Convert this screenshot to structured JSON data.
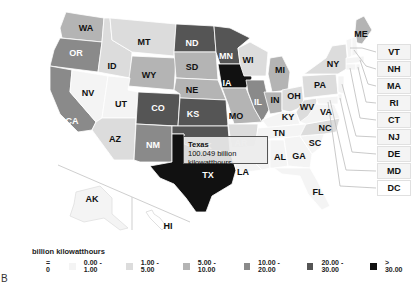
{
  "chart_data": {
    "type": "choropleth",
    "title": "",
    "legend_title": "billion kilowatthours",
    "bins": [
      {
        "label": "= 0",
        "color": "#ffffff"
      },
      {
        "label": "0.00 - 1.00",
        "color": "#f4f4f4"
      },
      {
        "label": "1.00 - 5.00",
        "color": "#dcdcdc"
      },
      {
        "label": "5.00 - 10.00",
        "color": "#b4b4b4"
      },
      {
        "label": "10.00 - 20.00",
        "color": "#8a8a8a"
      },
      {
        "label": "20.00 - 30.00",
        "color": "#555555"
      },
      {
        "label": "> 30.00",
        "color": "#111111"
      }
    ],
    "states": {
      "WA": 3,
      "OR": 4,
      "CA": 4,
      "NV": 1,
      "ID": 2,
      "MT": 2,
      "WY": 3,
      "UT": 1,
      "AZ": 2,
      "CO": 5,
      "NM": 4,
      "ND": 5,
      "SD": 3,
      "NE": 3,
      "KS": 5,
      "OK": 5,
      "TX": 6,
      "MN": 5,
      "IA": 6,
      "MO": 3,
      "AR": 2,
      "LA": 1,
      "WI": 2,
      "IL": 4,
      "MI": 3,
      "IN": 3,
      "OH": 2,
      "KY": 1,
      "TN": 1,
      "MS": 1,
      "AL": 1,
      "GA": 1,
      "FL": 1,
      "SC": 1,
      "NC": 2,
      "VA": 1,
      "WV": 2,
      "PA": 2,
      "NY": 2,
      "ME": 3,
      "VT": 1,
      "NH": 1,
      "MA": 1,
      "RI": 1,
      "CT": 1,
      "NJ": 1,
      "DE": 1,
      "MD": 1,
      "DC": 0,
      "AK": 1,
      "HI": 0
    },
    "highlight": {
      "state": "Texas",
      "value": 100.049,
      "unit": "billion kilowatthours"
    }
  },
  "tooltip": {
    "name": "Texas",
    "value": "100.049 billion kilowatthours"
  },
  "northeast_boxes": [
    "VT",
    "NH",
    "MA",
    "RI",
    "CT",
    "NJ",
    "DE",
    "MD",
    "DC"
  ],
  "panel_letter": "B"
}
